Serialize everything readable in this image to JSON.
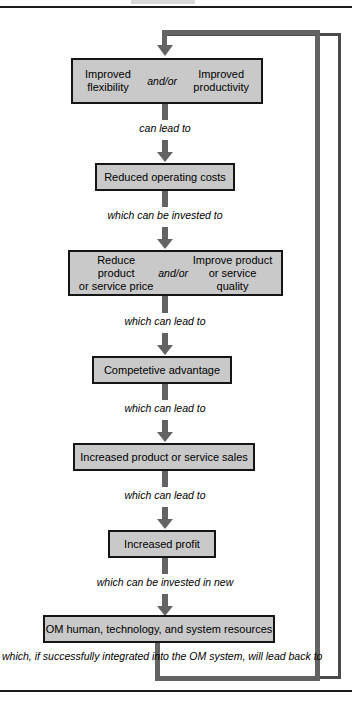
{
  "diagram": {
    "type": "flowchart",
    "colors": {
      "node_fill": "#c9c9c9",
      "node_border": "#151515",
      "connector": "#636363",
      "frame_border": "#4a4a4a",
      "rule": "#1b1b1b",
      "text": "#000000"
    },
    "nodes": [
      {
        "id": "node-flexibility-productivity",
        "kind": "split",
        "left_text": "Improved\nflexibility",
        "connector_text": "and/or",
        "right_text": "Improved\nproductivity"
      },
      {
        "id": "node-reduced-operating-costs",
        "kind": "single",
        "text": "Reduced operating costs"
      },
      {
        "id": "node-price-quality",
        "kind": "split",
        "left_text": "Reduce product\nor service price",
        "connector_text": "and/or",
        "right_text": "Improve product\nor service quality"
      },
      {
        "id": "node-competitive-advantage",
        "kind": "single",
        "text": "Competetive advantage"
      },
      {
        "id": "node-increased-sales",
        "kind": "single",
        "text": "Increased product or service sales"
      },
      {
        "id": "node-increased-profit",
        "kind": "single",
        "text": "Increased profit"
      },
      {
        "id": "node-om-resources",
        "kind": "single",
        "text": "OM human, technology, and system resources"
      }
    ],
    "edge_labels": [
      {
        "id": "edge-1",
        "text": "can lead to"
      },
      {
        "id": "edge-2",
        "text": "which can be invested to"
      },
      {
        "id": "edge-3",
        "text": "which can lead to"
      },
      {
        "id": "edge-4",
        "text": "which can lead to"
      },
      {
        "id": "edge-5",
        "text": "which can lead to"
      },
      {
        "id": "edge-6",
        "text": "which can be invested in new"
      }
    ],
    "feedback_label": "which, if successfully integrated into the OM system, will lead back to"
  }
}
